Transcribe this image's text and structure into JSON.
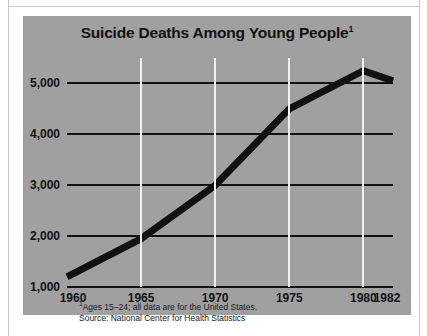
{
  "chart_data": {
    "type": "line",
    "title": "Suicide Deaths Among Young People",
    "title_superscript": "1",
    "xlabel": "",
    "ylabel": "",
    "x": [
      1960,
      1965,
      1970,
      1975,
      1980,
      1982
    ],
    "values": [
      1200,
      1950,
      3000,
      4500,
      5250,
      5050
    ],
    "series": [
      {
        "name": "Suicide deaths, ages 15-24",
        "values": [
          1200,
          1950,
          3000,
          4500,
          5250,
          5050
        ]
      }
    ],
    "x_tick_labels": [
      "1960",
      "1965",
      "1970",
      "1975",
      "1980",
      "1982"
    ],
    "y_tick_labels": [
      "1,000",
      "2,000",
      "3,000",
      "4,000",
      "5,000"
    ],
    "y_ticks": [
      1000,
      2000,
      3000,
      4000,
      5000
    ],
    "xlim": [
      1960,
      1982
    ],
    "ylim": [
      1000,
      5500
    ],
    "grid": "horizontal-black-and-vertical-white",
    "vertical_gridlines_at": [
      1965,
      1970,
      1975,
      1980
    ],
    "legend": null,
    "legend_position": "none",
    "annotations": [
      "1Ages 15-24; all data are for the United States.",
      "Source: National Center for Health Statistics"
    ],
    "colors": {
      "panel_background": "#a0a0a0",
      "series_line": "#111111",
      "horizontal_gridline": "#111111",
      "vertical_gridline": "#f2f2f2",
      "text": "#111111",
      "page_background": "#ffffff"
    }
  },
  "footnotes": {
    "note_marker": "1",
    "note_text": "Ages 15–24; all data are for the United States.",
    "source_text": "Source: National Center for Health Statistics"
  }
}
